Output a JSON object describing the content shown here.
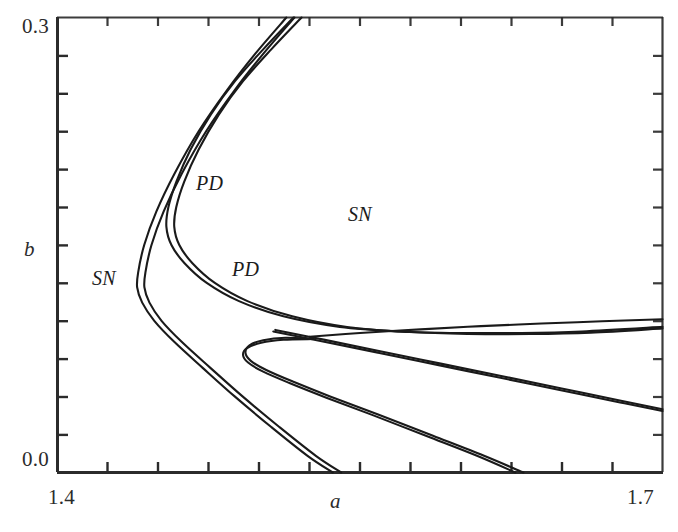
{
  "figure": {
    "kind": "bifurcation-diagram",
    "background_color": "#ffffff",
    "curve_color": "#1a1a1a"
  },
  "axes": {
    "x_title": "a",
    "y_title": "b",
    "x_ticks_labeled": [
      "1.4",
      "1.7"
    ],
    "y_ticks_labeled": [
      "0.0",
      "0.3"
    ],
    "x_min_label": "1.4",
    "x_max_label": "1.7",
    "y_min_label": "0.0",
    "y_max_label": "0.3",
    "x_minor_tick_count": 11,
    "y_minor_tick_count": 11,
    "grid": "off",
    "frame": "left-and-bottom-with-ticks"
  },
  "annotations": {
    "sn_left": "SN",
    "pd_upper": "PD",
    "pd_lower": "PD",
    "sn_mid": "SN"
  },
  "chart_data": {
    "type": "line",
    "title": "",
    "xlabel": "a",
    "ylabel": "b",
    "xlim": [
      1.4,
      1.7
    ],
    "ylim": [
      0.0,
      0.3
    ],
    "xticks": [
      1.4,
      1.7
    ],
    "yticks": [
      0.0,
      0.3
    ],
    "grid": false,
    "legend": "inline-annotations",
    "series": [
      {
        "name": "SN outer (saddle-node, left fold)",
        "label": "SN",
        "points": [
          [
            1.5135,
            0.3
          ],
          [
            1.498,
            0.276
          ],
          [
            1.484,
            0.252
          ],
          [
            1.47,
            0.225
          ],
          [
            1.458,
            0.197
          ],
          [
            1.449,
            0.172
          ],
          [
            1.443,
            0.15
          ],
          [
            1.44,
            0.132
          ],
          [
            1.4395,
            0.122
          ],
          [
            1.442,
            0.112
          ],
          [
            1.448,
            0.1
          ],
          [
            1.458,
            0.086
          ],
          [
            1.472,
            0.069
          ],
          [
            1.488,
            0.05
          ],
          [
            1.506,
            0.03
          ],
          [
            1.524,
            0.011
          ],
          [
            1.5365,
            0.0
          ]
        ]
      },
      {
        "name": "SN outer companion (close pair)",
        "label": "SN",
        "points": [
          [
            1.5175,
            0.3
          ],
          [
            1.502,
            0.276
          ],
          [
            1.4878,
            0.252
          ],
          [
            1.4737,
            0.225
          ],
          [
            1.4616,
            0.197
          ],
          [
            1.4526,
            0.172
          ],
          [
            1.4466,
            0.15
          ],
          [
            1.4436,
            0.132
          ],
          [
            1.4431,
            0.122
          ],
          [
            1.4456,
            0.112
          ],
          [
            1.4516,
            0.1
          ],
          [
            1.4617,
            0.086
          ],
          [
            1.4758,
            0.069
          ],
          [
            1.4919,
            0.05
          ],
          [
            1.51,
            0.03
          ],
          [
            1.5281,
            0.011
          ],
          [
            1.5407,
            0.0
          ]
        ]
      },
      {
        "name": "PD upper (period-doubling, left fold)",
        "label": "PD",
        "points": [
          [
            1.517,
            0.3
          ],
          [
            1.502,
            0.279
          ],
          [
            1.488,
            0.258
          ],
          [
            1.476,
            0.236
          ],
          [
            1.466,
            0.213
          ],
          [
            1.459,
            0.192
          ],
          [
            1.455,
            0.175
          ],
          [
            1.454,
            0.162
          ],
          [
            1.4565,
            0.15
          ],
          [
            1.463,
            0.138
          ],
          [
            1.474,
            0.125
          ],
          [
            1.49,
            0.113
          ],
          [
            1.512,
            0.103
          ],
          [
            1.54,
            0.096
          ],
          [
            1.57,
            0.093
          ],
          [
            1.599,
            0.092
          ],
          [
            1.63,
            0.092
          ],
          [
            1.66,
            0.093
          ],
          [
            1.7,
            0.096
          ]
        ]
      },
      {
        "name": "PD upper companion (close pair)",
        "label": "PD",
        "points": [
          [
            1.521,
            0.3
          ],
          [
            1.506,
            0.279
          ],
          [
            1.492,
            0.258
          ],
          [
            1.48,
            0.236
          ],
          [
            1.47,
            0.213
          ],
          [
            1.4629,
            0.192
          ],
          [
            1.4589,
            0.175
          ],
          [
            1.4579,
            0.162
          ],
          [
            1.4604,
            0.15
          ],
          [
            1.4669,
            0.138
          ],
          [
            1.478,
            0.125
          ],
          [
            1.4942,
            0.113
          ],
          [
            1.5164,
            0.103
          ],
          [
            1.5444,
            0.0958
          ],
          [
            1.5744,
            0.0926
          ],
          [
            1.6034,
            0.0914
          ],
          [
            1.6344,
            0.0913
          ],
          [
            1.6644,
            0.0922
          ],
          [
            1.7,
            0.095
          ]
        ]
      },
      {
        "name": "PD inner loop (left fold, lower)",
        "label": "PD",
        "points": [
          [
            1.527,
            0.088
          ],
          [
            1.512,
            0.0875
          ],
          [
            1.501,
            0.0855
          ],
          [
            1.494,
            0.082
          ],
          [
            1.492,
            0.0775
          ],
          [
            1.4945,
            0.0725
          ],
          [
            1.502,
            0.0665
          ],
          [
            1.515,
            0.059
          ],
          [
            1.533,
            0.0495
          ],
          [
            1.556,
            0.038
          ],
          [
            1.583,
            0.024
          ],
          [
            1.608,
            0.011
          ],
          [
            1.627,
            0.0
          ]
        ]
      },
      {
        "name": "PD inner loop companion (close pair)",
        "label": "PD",
        "points": [
          [
            1.527,
            0.088
          ],
          [
            1.513,
            0.0888
          ],
          [
            1.502,
            0.0872
          ],
          [
            1.4952,
            0.0838
          ],
          [
            1.4932,
            0.079
          ],
          [
            1.4957,
            0.0738
          ],
          [
            1.5035,
            0.0676
          ],
          [
            1.517,
            0.0598
          ],
          [
            1.5355,
            0.05
          ],
          [
            1.559,
            0.0383
          ],
          [
            1.5862,
            0.0242
          ],
          [
            1.6115,
            0.011
          ],
          [
            1.631,
            0.0
          ]
        ]
      },
      {
        "name": "SN mid branch (rising to right edge)",
        "label": "SN",
        "points": [
          [
            1.525,
            0.0895
          ],
          [
            1.55,
            0.092
          ],
          [
            1.58,
            0.0944
          ],
          [
            1.61,
            0.0965
          ],
          [
            1.64,
            0.0982
          ],
          [
            1.67,
            0.0997
          ],
          [
            1.7,
            0.101
          ]
        ]
      },
      {
        "name": "SN mid branch descending to right edge",
        "label": "SN",
        "points": [
          [
            1.508,
            0.094
          ],
          [
            1.532,
            0.0876
          ],
          [
            1.56,
            0.08
          ],
          [
            1.59,
            0.0718
          ],
          [
            1.62,
            0.0636
          ],
          [
            1.65,
            0.0554
          ],
          [
            1.68,
            0.0472
          ],
          [
            1.7,
            0.0417
          ]
        ]
      },
      {
        "name": "SN mid branch descending companion",
        "label": "SN",
        "points": [
          [
            1.507,
            0.093
          ],
          [
            1.531,
            0.0866
          ],
          [
            1.559,
            0.079
          ],
          [
            1.589,
            0.0708
          ],
          [
            1.619,
            0.0626
          ],
          [
            1.649,
            0.0544
          ],
          [
            1.679,
            0.0462
          ],
          [
            1.7,
            0.0405
          ]
        ]
      }
    ]
  }
}
